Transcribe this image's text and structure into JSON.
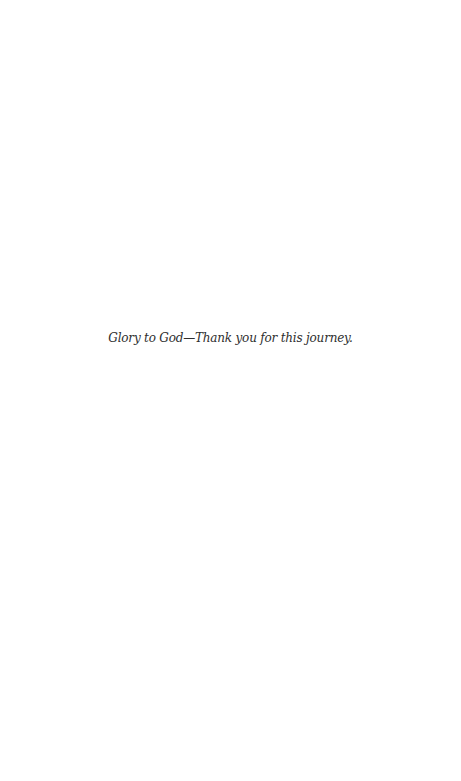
{
  "page": {
    "background": "#ffffff",
    "dedication": {
      "text": "Glory to God—Thank you for this journey.",
      "color": "#2e2e2e"
    }
  }
}
